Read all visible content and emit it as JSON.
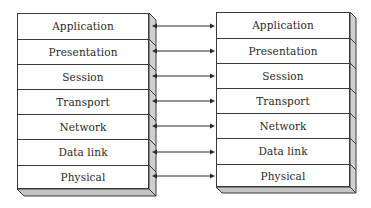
{
  "diagram": {
    "type": "osi-model-peer-communication",
    "layers": [
      "Application",
      "Presentation",
      "Session",
      "Transport",
      "Network",
      "Data link",
      "Physical"
    ],
    "left_stack": {
      "x": 17,
      "y": 13,
      "width": 132,
      "row_heights": [
        26,
        25,
        25,
        25,
        25,
        26,
        24
      ],
      "depth": 7
    },
    "right_stack": {
      "x": 216,
      "y": 12,
      "width": 134,
      "row_heights": [
        26,
        25,
        25,
        25,
        25,
        26,
        23
      ],
      "depth": 6
    },
    "connector": {
      "style": "bidirectional-arrow",
      "color": "#2a2a2a"
    },
    "colors": {
      "face": "#ffffff",
      "side": "#cfcfcf",
      "bottom": "#c4c4c4",
      "stroke": "#3a3a3a"
    }
  }
}
